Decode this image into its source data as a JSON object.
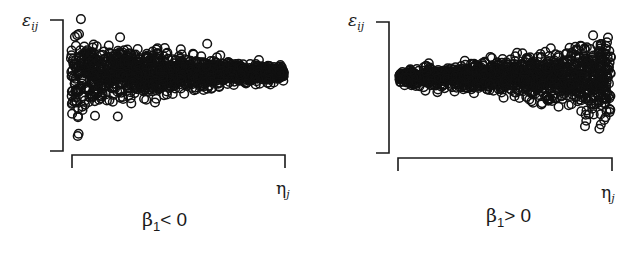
{
  "chart_data": [
    {
      "type": "scatter",
      "title": "",
      "caption": "β1 < 0",
      "xlabel": "η_j",
      "ylabel": "ε_ij",
      "grid": false,
      "legend": null,
      "description": "Residuals funnel that narrows as η_j increases (variance decreasing)",
      "spread_profile": {
        "x": [
          0,
          0.1,
          0.3,
          0.5,
          0.7,
          0.9,
          1.0
        ],
        "half_width": [
          0.85,
          0.55,
          0.4,
          0.3,
          0.2,
          0.13,
          0.12
        ]
      },
      "center": 0.4
    },
    {
      "type": "scatter",
      "title": "",
      "caption": "β1 > 0",
      "xlabel": "η_j",
      "ylabel": "ε_ij",
      "grid": false,
      "legend": null,
      "description": "Residuals funnel that widens as η_j increases (variance increasing)",
      "spread_profile": {
        "x": [
          0,
          0.1,
          0.3,
          0.5,
          0.7,
          0.9,
          1.0
        ],
        "half_width": [
          0.1,
          0.12,
          0.18,
          0.28,
          0.4,
          0.55,
          0.75
        ]
      },
      "center": 0.42
    }
  ],
  "left": {
    "ylabel_main": "ε",
    "ylabel_sub": "ij",
    "xlabel_main": "η",
    "xlabel_sub": "j",
    "cap_beta": "β",
    "cap_sub": "1",
    "cap_rel": "< 0"
  },
  "right": {
    "ylabel_main": "ε",
    "ylabel_sub": "ij",
    "xlabel_main": "η",
    "xlabel_sub": "j",
    "cap_beta": "β",
    "cap_sub": "1",
    "cap_rel": "> 0"
  }
}
